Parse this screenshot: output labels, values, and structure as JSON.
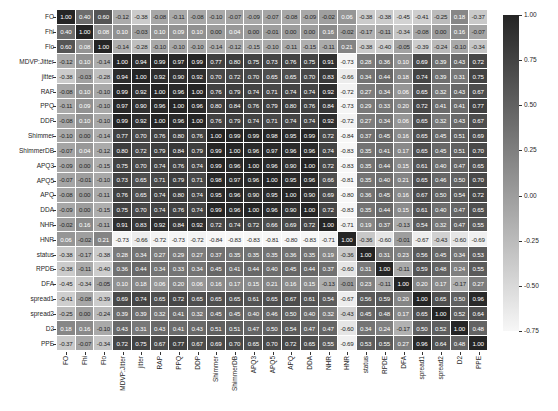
{
  "chart_data": {
    "type": "heatmap",
    "title": "",
    "xlabel": "",
    "ylabel": "",
    "labels": [
      "FO",
      "Fhi",
      "Flo",
      "MDVP:Jitter",
      "jitter",
      "RAP",
      "PPQ",
      "DDP",
      "Shimmer",
      "ShimmerDB",
      "APQ3",
      "APQ5",
      "APQ",
      "DDA",
      "NHR",
      "HNR",
      "status",
      "RPDE",
      "DFA",
      "spread1",
      "spread2",
      "D2",
      "PPE"
    ],
    "matrix": [
      [
        1.0,
        0.4,
        0.6,
        -0.12,
        -0.38,
        -0.08,
        -0.11,
        -0.08,
        -0.1,
        -0.07,
        -0.09,
        -0.07,
        -0.08,
        -0.09,
        -0.02,
        0.06,
        -0.38,
        -0.38,
        -0.45,
        -0.41,
        -0.25,
        0.18,
        -0.37
      ],
      [
        0.4,
        1.0,
        0.08,
        0.1,
        -0.03,
        0.1,
        0.09,
        0.1,
        0.0,
        0.04,
        -0.0,
        -0.01,
        0.0,
        -0.0,
        0.16,
        -0.02,
        -0.17,
        -0.11,
        -0.34,
        -0.08,
        -0.0,
        0.16,
        -0.07
      ],
      [
        0.6,
        0.08,
        1.0,
        -0.14,
        -0.28,
        -0.1,
        -0.1,
        -0.1,
        -0.14,
        -0.12,
        -0.15,
        -0.1,
        -0.11,
        -0.15,
        -0.11,
        0.21,
        -0.38,
        -0.4,
        -0.05,
        -0.39,
        -0.24,
        -0.1,
        -0.34
      ],
      [
        -0.12,
        0.1,
        -0.14,
        1.0,
        0.94,
        0.99,
        0.97,
        0.99,
        0.77,
        0.8,
        0.75,
        0.73,
        0.76,
        0.75,
        0.91,
        -0.73,
        0.28,
        0.36,
        0.1,
        0.69,
        0.39,
        0.43,
        0.72
      ],
      [
        -0.38,
        -0.03,
        -0.28,
        0.94,
        1.0,
        0.92,
        0.9,
        0.92,
        0.7,
        0.72,
        0.7,
        0.65,
        0.65,
        0.7,
        0.83,
        -0.66,
        0.34,
        0.44,
        0.18,
        0.74,
        0.39,
        0.31,
        0.75
      ],
      [
        -0.08,
        0.1,
        -0.1,
        0.99,
        0.92,
        1.0,
        0.96,
        1.0,
        0.76,
        0.79,
        0.74,
        0.71,
        0.74,
        0.74,
        0.92,
        -0.72,
        0.27,
        0.34,
        0.06,
        0.65,
        0.32,
        0.43,
        0.67
      ],
      [
        -0.11,
        0.09,
        -0.1,
        0.97,
        0.9,
        0.96,
        1.0,
        0.96,
        0.8,
        0.84,
        0.76,
        0.79,
        0.8,
        0.76,
        0.84,
        -0.73,
        0.29,
        0.33,
        0.2,
        0.72,
        0.41,
        0.41,
        0.77
      ],
      [
        -0.08,
        0.1,
        -0.1,
        0.99,
        0.92,
        1.0,
        0.96,
        1.0,
        0.76,
        0.79,
        0.74,
        0.71,
        0.74,
        0.74,
        0.92,
        -0.72,
        0.27,
        0.34,
        0.06,
        0.65,
        0.32,
        0.43,
        0.67
      ],
      [
        -0.1,
        0.0,
        -0.14,
        0.77,
        0.7,
        0.76,
        0.8,
        0.76,
        1.0,
        0.99,
        0.99,
        0.98,
        0.95,
        0.99,
        0.72,
        -0.84,
        0.37,
        0.45,
        0.16,
        0.65,
        0.45,
        0.51,
        0.69
      ],
      [
        -0.07,
        0.04,
        -0.12,
        0.8,
        0.72,
        0.79,
        0.84,
        0.79,
        0.99,
        1.0,
        0.96,
        0.97,
        0.96,
        0.96,
        0.74,
        -0.83,
        0.35,
        0.41,
        0.17,
        0.65,
        0.45,
        0.51,
        0.7
      ],
      [
        -0.09,
        -0.0,
        -0.15,
        0.75,
        0.7,
        0.74,
        0.76,
        0.74,
        0.99,
        0.96,
        1.0,
        0.96,
        0.9,
        1.0,
        0.72,
        -0.83,
        0.35,
        0.44,
        0.15,
        0.61,
        0.4,
        0.47,
        0.65
      ],
      [
        -0.07,
        -0.01,
        -0.1,
        0.73,
        0.65,
        0.71,
        0.79,
        0.71,
        0.98,
        0.97,
        0.96,
        1.0,
        0.95,
        0.96,
        0.66,
        -0.81,
        0.35,
        0.4,
        0.21,
        0.65,
        0.46,
        0.5,
        0.7
      ],
      [
        -0.08,
        0.0,
        -0.11,
        0.76,
        0.65,
        0.74,
        0.8,
        0.74,
        0.95,
        0.96,
        0.9,
        0.95,
        1.0,
        0.9,
        0.69,
        -0.8,
        0.36,
        0.45,
        0.16,
        0.67,
        0.5,
        0.54,
        0.72
      ],
      [
        -0.09,
        -0.0,
        -0.15,
        0.75,
        0.7,
        0.74,
        0.76,
        0.74,
        0.99,
        0.96,
        1.0,
        0.96,
        0.9,
        1.0,
        0.72,
        -0.83,
        0.35,
        0.44,
        0.15,
        0.61,
        0.4,
        0.47,
        0.65
      ],
      [
        -0.02,
        0.16,
        -0.11,
        0.91,
        0.83,
        0.92,
        0.84,
        0.92,
        0.72,
        0.74,
        0.72,
        0.66,
        0.69,
        0.72,
        1.0,
        -0.71,
        0.19,
        0.37,
        -0.13,
        0.54,
        0.32,
        0.47,
        0.55
      ],
      [
        0.06,
        -0.02,
        0.21,
        -0.73,
        -0.66,
        -0.72,
        -0.73,
        -0.72,
        -0.84,
        -0.83,
        -0.83,
        -0.81,
        -0.8,
        -0.83,
        -0.71,
        1.0,
        -0.36,
        -0.6,
        -0.01,
        -0.67,
        -0.43,
        -0.6,
        -0.69
      ],
      [
        -0.38,
        -0.17,
        -0.38,
        0.28,
        0.34,
        0.27,
        0.29,
        0.27,
        0.37,
        0.35,
        0.35,
        0.35,
        0.36,
        0.35,
        0.19,
        -0.36,
        1.0,
        0.31,
        0.23,
        0.56,
        0.45,
        0.34,
        0.53
      ],
      [
        -0.38,
        -0.11,
        -0.4,
        0.36,
        0.44,
        0.34,
        0.33,
        0.34,
        0.45,
        0.41,
        0.44,
        0.4,
        0.45,
        0.44,
        0.37,
        -0.6,
        0.31,
        1.0,
        -0.11,
        0.59,
        0.48,
        0.24,
        0.55
      ],
      [
        -0.45,
        -0.34,
        -0.05,
        0.1,
        0.18,
        0.06,
        0.2,
        0.06,
        0.16,
        0.17,
        0.15,
        0.21,
        0.16,
        0.15,
        -0.13,
        -0.01,
        0.23,
        -0.11,
        1.0,
        0.2,
        0.17,
        -0.17,
        0.27
      ],
      [
        -0.41,
        -0.08,
        -0.39,
        0.69,
        0.74,
        0.65,
        0.72,
        0.65,
        0.65,
        0.65,
        0.61,
        0.65,
        0.67,
        0.61,
        0.54,
        -0.67,
        0.56,
        0.59,
        0.2,
        1.0,
        0.65,
        0.5,
        0.96
      ],
      [
        -0.25,
        -0.0,
        -0.24,
        0.39,
        0.39,
        0.32,
        0.41,
        0.32,
        0.45,
        0.45,
        0.4,
        0.46,
        0.5,
        0.4,
        0.32,
        -0.43,
        0.45,
        0.48,
        0.17,
        0.65,
        1.0,
        0.52,
        0.64
      ],
      [
        0.18,
        0.16,
        -0.1,
        0.43,
        0.31,
        0.43,
        0.41,
        0.43,
        0.51,
        0.51,
        0.47,
        0.5,
        0.54,
        0.47,
        0.47,
        -0.6,
        0.34,
        0.24,
        -0.17,
        0.5,
        0.52,
        1.0,
        0.48
      ],
      [
        -0.37,
        -0.07,
        -0.34,
        0.72,
        0.75,
        0.67,
        0.77,
        0.67,
        0.69,
        0.7,
        0.65,
        0.7,
        0.72,
        0.65,
        0.55,
        -0.69,
        0.53,
        0.55,
        0.27,
        0.96,
        0.64,
        0.48,
        1.0
      ]
    ],
    "colorbar": {
      "vmin": -0.75,
      "vmax": 1.0,
      "ticks": [
        "1.00",
        "0.75",
        "0.50",
        "0.25",
        "0.00",
        "-0.25",
        "-0.50",
        "-0.75"
      ],
      "colormap": "grayscale",
      "low_color": "#f7f7f7",
      "high_color": "#252525"
    },
    "annotations": true,
    "grid": false,
    "legend_position": "right"
  }
}
